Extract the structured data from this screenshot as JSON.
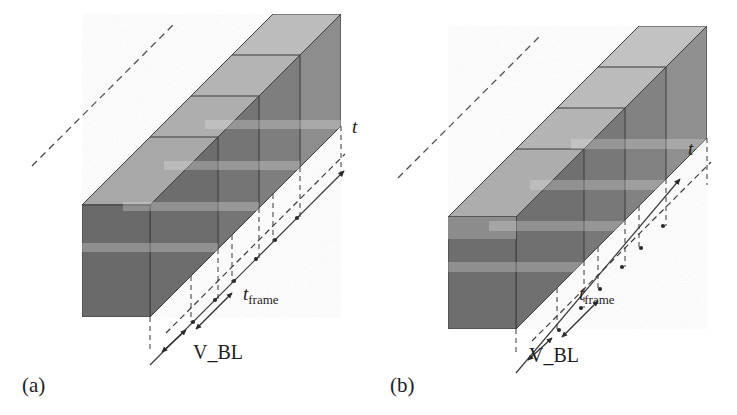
{
  "figure": {
    "background_color": "#ffffff",
    "ink_color": "#1d1d1d",
    "panels": [
      {
        "id": "a",
        "label": "(a)",
        "label_x": 22,
        "label_y": 392,
        "origin_x": 18,
        "origin_y": 8,
        "slab_style": "narrow-band",
        "slab_count": 4,
        "time_axis": {
          "label": "t",
          "label_x": 352,
          "label_y": 133
        },
        "frame_time": {
          "label_main": "t",
          "label_sub": "frame",
          "label_x": 243,
          "label_y": 300
        },
        "blanking": {
          "label": "V_BL",
          "label_x": 193,
          "label_y": 359
        },
        "xy_axes": {
          "x_label": "x",
          "y_label": "y",
          "x_label_x": 47,
          "x_label_y": 327,
          "y_label_x": 26,
          "y_label_y": 297
        }
      },
      {
        "id": "b",
        "label": "(b)",
        "label_x": 390,
        "label_y": 392,
        "origin_x": 386,
        "origin_y": 8,
        "slab_style": "wide-band",
        "slab_count": 4,
        "time_axis": {
          "label": "t",
          "label_x": 688,
          "label_y": 155
        },
        "frame_time": {
          "label_main": "t",
          "label_sub": "frame",
          "label_x": 579,
          "label_y": 300
        },
        "blanking": {
          "label": "V_BL",
          "label_x": 529,
          "label_y": 362
        },
        "xy_axes": {
          "x_label": "x",
          "y_label": "y",
          "x_label_x": 428,
          "x_label_y": 333,
          "y_label_x": 407,
          "y_label_y": 303
        }
      }
    ],
    "colors": {
      "slab_face_light": "#9a9a9a",
      "slab_face_mid": "#8a8a8a",
      "slab_face_dark": "#6e6e6e",
      "slab_band_light": "#b4b4b4",
      "slab_band_highlight": "#c2c2c2",
      "slab_edge": "#3a3a3a",
      "overlap_dark": "#636363",
      "guide_line": "#4a4a4a",
      "axis_line": "#3a3a3a",
      "xy_axis_color": "#ffffff"
    },
    "geometry": {
      "slab_width": 150,
      "slab_height": 112,
      "band_height_narrow": 13,
      "band_height_wide": 30,
      "step_dx": 41,
      "step_dy": -41,
      "depth_dx": 68,
      "depth_dy": -68,
      "note": "isometric-style 45 degree receding time axis"
    }
  }
}
